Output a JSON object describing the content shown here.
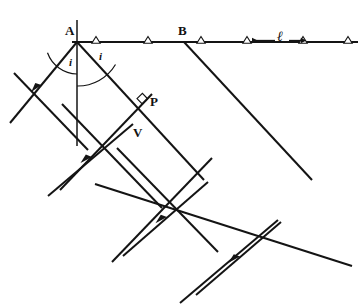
{
  "figure": {
    "kind": "optics-reflection-wavefront-diagram",
    "background_color": "#ffffff",
    "ink_color": "#141414",
    "width": 364,
    "height": 305
  },
  "labels": {
    "point_a": "A",
    "point_b": "B",
    "point_p": "P",
    "point_v": "V",
    "angle_incidence": "i",
    "angle_reflection": "i",
    "length_l": "ℓ"
  },
  "geometry": {
    "mirror_line": {
      "x1": 72,
      "y1": 42,
      "x2": 358,
      "y2": 42
    },
    "normal_line": {
      "x1": 77,
      "y1": 20,
      "x2": 77,
      "y2": 146
    },
    "vertex_a": {
      "x": 77,
      "y": 42
    },
    "vertex_b": {
      "x": 184,
      "y": 42
    },
    "point_p": {
      "x": 145,
      "y": 101
    },
    "point_v": {
      "x": 133,
      "y": 124
    },
    "hatch_markers": [
      {
        "x": 96,
        "y": 42
      },
      {
        "x": 148,
        "y": 42
      },
      {
        "x": 201,
        "y": 42
      },
      {
        "x": 247,
        "y": 42
      },
      {
        "x": 303,
        "y": 42
      },
      {
        "x": 348,
        "y": 42
      }
    ],
    "length_arrow_left": {
      "x1": 276,
      "y1": 41,
      "x2": 250,
      "y2": 41
    },
    "length_arrow_right": {
      "x1": 288,
      "y1": 41,
      "x2": 303,
      "y2": 41
    },
    "incident_rays": [
      {
        "x1": 10,
        "y1": 123,
        "x2": 77,
        "y2": 42,
        "arrow_t": 0.42
      },
      {
        "x1": 48,
        "y1": 196,
        "x2": 133,
        "y2": 124,
        "arrow_t": 0.45
      },
      {
        "x1": 123,
        "y1": 256,
        "x2": 208,
        "y2": 182,
        "arrow_t": 0.45
      },
      {
        "x1": 196,
        "y1": 295,
        "x2": 281,
        "y2": 222,
        "arrow_t": 0.45
      }
    ],
    "reflected_rays": [
      {
        "x1": 77,
        "y1": 42,
        "x2": 196,
        "y2": 170,
        "arrow_t": 0.0
      },
      {
        "x1": 184,
        "y1": 42,
        "x2": 300,
        "y2": 168,
        "arrow_t": 0.0
      }
    ],
    "incident_wavefronts": [
      {
        "x1": 14,
        "y1": 73,
        "x2": 88,
        "y2": 150
      },
      {
        "x1": 62,
        "y1": 104,
        "x2": 158,
        "y2": 204
      },
      {
        "x1": 117,
        "y1": 148,
        "x2": 214,
        "y2": 248
      }
    ],
    "reflected_wavefronts": [
      {
        "x1": 145,
        "y1": 101,
        "x2": 74,
        "y2": 177
      },
      {
        "x1": 205,
        "y1": 165,
        "x2": 118,
        "y2": 257
      },
      {
        "x1": 270,
        "y1": 227,
        "x2": 184,
        "y2": 300
      }
    ],
    "long_reflected_ray": {
      "x1": 95,
      "y1": 184,
      "x2": 345,
      "y2": 262
    },
    "right_angle_marker": {
      "x": 145,
      "y": 101
    },
    "arc_incidence": {
      "cx": 77,
      "cy": 42,
      "r": 34,
      "a1": 180,
      "a2": 230
    },
    "arc_reflection": {
      "cx": 77,
      "cy": 42,
      "r": 44,
      "a1": 315,
      "a2": 360
    }
  }
}
